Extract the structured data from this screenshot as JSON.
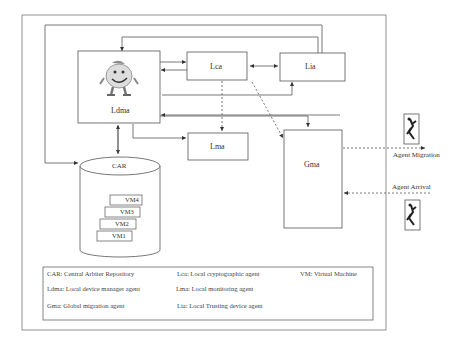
{
  "nodes": {
    "ldma": "Ldma",
    "lca": "Lca",
    "lia": "Lia",
    "lma": "Lma",
    "gma": "Gma",
    "car": "CAR",
    "vms": [
      "VM4",
      "VM3",
      "VM2",
      "VM1"
    ]
  },
  "external": {
    "migration_label": "Agent Migration",
    "arrival_label": "Agent Arrival"
  },
  "legend": {
    "items": [
      "CAR: Central Arbiter Repository",
      "Lca: Local cryptographic agent",
      "VM: Virtual Machine",
      "Ldma: Local device manager agent",
      "Lma: Local monitoring agent",
      "Gma: Global migration agent",
      "Lia: Local Trusting device agent"
    ]
  },
  "icons": {
    "mascot": "cartoon-agent-icon",
    "agent": "running-agent-icon"
  }
}
